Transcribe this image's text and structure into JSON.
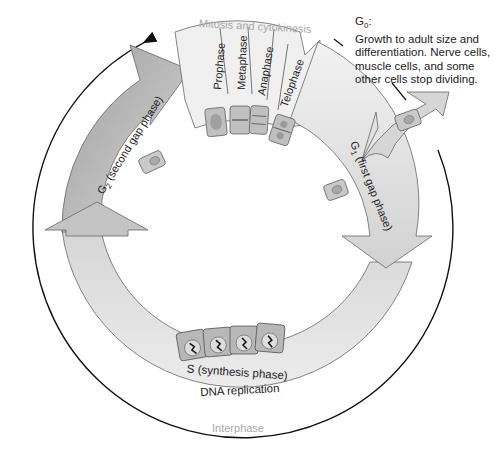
{
  "diagram": {
    "outer_label": "Interphase",
    "mitosis_label": "Mitosis and cytokinesis",
    "mitosis_phases": [
      "Prophase",
      "Metaphase",
      "Anaphase",
      "Telophase"
    ],
    "phases": {
      "g1": {
        "symbol": "G",
        "sub": "1",
        "label": " (first gap phase)"
      },
      "s": {
        "label": "S (synthesis phase)",
        "detail": "DNA replication"
      },
      "g2": {
        "symbol": "G",
        "sub": "2",
        "label": " (second gap phase)"
      },
      "g0": {
        "symbol": "G",
        "sub": "0",
        "suffix": ":",
        "description": "Growth to adult  size and differentiation. Nerve cells, muscle cells, and some other cells stop dividing."
      }
    },
    "colors": {
      "ring_light": "#e6e6e6",
      "ring_dark": "#b8b8b8",
      "mitosis_band": "#efefef",
      "outline": "#555555",
      "outer_arrow": "#111111",
      "faint_text": "#a8a8a8",
      "text": "#222222"
    }
  }
}
